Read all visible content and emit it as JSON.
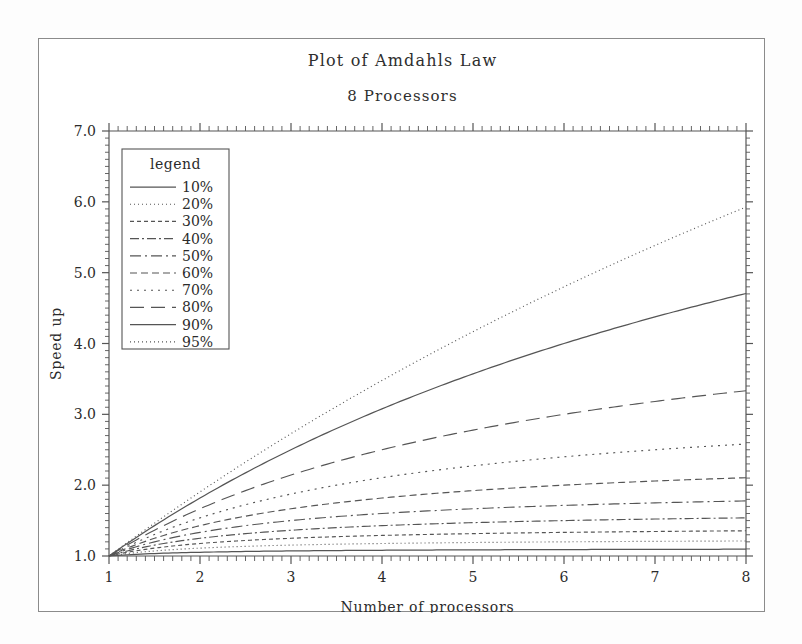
{
  "figure": {
    "title": "Plot of Amdahls Law",
    "subtitle": "8 Processors",
    "frame_color": "#8b8b8b",
    "background": "#ffffff",
    "line_color": "#555555"
  },
  "legend": {
    "title": "legend",
    "position": "top-left-inside"
  },
  "chart_data": {
    "type": "line",
    "title": "Plot of Amdahls Law",
    "subtitle": "8 Processors",
    "xlabel": "Number of processors",
    "ylabel": "Speed up",
    "xlim": [
      1,
      8
    ],
    "ylim": [
      1.0,
      7.0
    ],
    "xticks": [
      1,
      2,
      3,
      4,
      5,
      6,
      7,
      8
    ],
    "yticks": [
      "1.0",
      "2.0",
      "3.0",
      "4.0",
      "5.0",
      "6.0",
      "7.0"
    ],
    "grid": false,
    "minor_ticks": true,
    "legend_position": "upper left",
    "x": [
      1,
      1.5,
      2,
      2.5,
      3,
      3.5,
      4,
      4.5,
      5,
      5.5,
      6,
      6.5,
      7,
      7.5,
      8
    ],
    "series": [
      {
        "name": "10%",
        "label": "10%",
        "dash": "none",
        "parallel_fraction": 0.1,
        "values": [
          1.0,
          1.036,
          1.053,
          1.064,
          1.071,
          1.076,
          1.081,
          1.084,
          1.087,
          1.089,
          1.091,
          1.093,
          1.094,
          1.095,
          1.096
        ]
      },
      {
        "name": "20%",
        "label": "20%",
        "dash": "1,3",
        "parallel_fraction": 0.2,
        "values": [
          1.0,
          1.071,
          1.111,
          1.136,
          1.154,
          1.167,
          1.176,
          1.184,
          1.19,
          1.195,
          1.2,
          1.203,
          1.206,
          1.209,
          1.212
        ]
      },
      {
        "name": "30%",
        "label": "30%",
        "dash": "4,3",
        "parallel_fraction": 0.3,
        "values": [
          1.0,
          1.111,
          1.176,
          1.22,
          1.25,
          1.273,
          1.29,
          1.304,
          1.316,
          1.325,
          1.333,
          1.34,
          1.346,
          1.351,
          1.356
        ]
      },
      {
        "name": "40%",
        "label": "40%",
        "dash": "9,3,2,3",
        "parallel_fraction": 0.4,
        "values": [
          1.0,
          1.154,
          1.25,
          1.316,
          1.364,
          1.4,
          1.429,
          1.452,
          1.471,
          1.486,
          1.5,
          1.511,
          1.522,
          1.53,
          1.538
        ]
      },
      {
        "name": "50%",
        "label": "50%",
        "dash": "11,4,2,4",
        "parallel_fraction": 0.5,
        "values": [
          1.0,
          1.2,
          1.333,
          1.429,
          1.5,
          1.556,
          1.6,
          1.636,
          1.667,
          1.692,
          1.714,
          1.733,
          1.75,
          1.765,
          1.778
        ]
      },
      {
        "name": "60%",
        "label": "60%",
        "dash": "7,4",
        "parallel_fraction": 0.6,
        "values": [
          1.0,
          1.25,
          1.429,
          1.563,
          1.667,
          1.75,
          1.818,
          1.875,
          1.923,
          1.964,
          2.0,
          2.031,
          2.059,
          2.083,
          2.105
        ]
      },
      {
        "name": "70%",
        "label": "70%",
        "dash": "2,5",
        "parallel_fraction": 0.7,
        "values": [
          1.0,
          1.304,
          1.538,
          1.724,
          1.875,
          2.0,
          2.105,
          2.195,
          2.273,
          2.34,
          2.4,
          2.452,
          2.5,
          2.542,
          2.581
        ]
      },
      {
        "name": "80%",
        "label": "80%",
        "dash": "14,7",
        "parallel_fraction": 0.8,
        "values": [
          1.0,
          1.364,
          1.667,
          1.923,
          2.143,
          2.333,
          2.5,
          2.647,
          2.778,
          2.895,
          3.0,
          3.095,
          3.182,
          3.261,
          3.333
        ]
      },
      {
        "name": "90%",
        "label": "90%",
        "dash": "none",
        "parallel_fraction": 0.9,
        "values": [
          1.0,
          1.429,
          1.818,
          2.174,
          2.5,
          2.8,
          3.077,
          3.333,
          3.571,
          3.793,
          4.0,
          4.194,
          4.375,
          4.545,
          4.706
        ]
      },
      {
        "name": "95%",
        "label": "95%",
        "dash": "1,3",
        "parallel_fraction": 0.95,
        "values": [
          1.0,
          1.463,
          1.905,
          2.326,
          2.727,
          3.111,
          3.478,
          3.83,
          4.167,
          4.49,
          4.8,
          5.098,
          5.385,
          5.66,
          5.926
        ]
      }
    ]
  }
}
